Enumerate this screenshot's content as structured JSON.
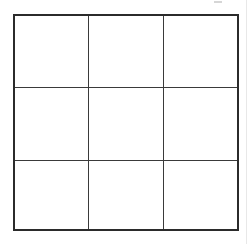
{
  "diagram": {
    "type": "grid",
    "rows": 3,
    "columns": 3,
    "cells": [
      [
        "",
        "",
        ""
      ],
      [
        "",
        "",
        ""
      ],
      [
        "",
        "",
        ""
      ]
    ],
    "colors": {
      "background": "#ffffff",
      "line": "#2b2b2b"
    }
  }
}
